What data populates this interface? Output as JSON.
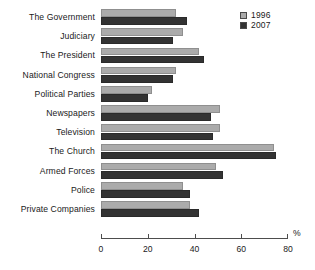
{
  "chart_data": {
    "type": "bar",
    "orientation": "horizontal",
    "title": "",
    "subtitle": "",
    "xlabel": "%",
    "ylabel": "",
    "xlim": [
      0,
      80
    ],
    "xticks": [
      0,
      20,
      40,
      60,
      80
    ],
    "grid": false,
    "legend_position": "top-right",
    "categories": [
      "The Government",
      "Judiciary",
      "The President",
      "National Congress",
      "Political Parties",
      "Newspapers",
      "Television",
      "The Church",
      "Armed Forces",
      "Police",
      "Private Companies"
    ],
    "series": [
      {
        "name": "1996",
        "color": "#ababab",
        "values": [
          32,
          35,
          42,
          32,
          22,
          51,
          51,
          74,
          49,
          35,
          38
        ]
      },
      {
        "name": "2007",
        "color": "#333333",
        "values": [
          37,
          31,
          44,
          31,
          20,
          47,
          48,
          75,
          52,
          38,
          42
        ]
      }
    ]
  },
  "legend": {
    "entries": [
      {
        "label": "1996",
        "swatch": "light-gray-swatch"
      },
      {
        "label": "2007",
        "swatch": "dark-swatch"
      }
    ]
  },
  "axis": {
    "unit_label": "%",
    "tick_labels": [
      "0",
      "20",
      "40",
      "60",
      "80"
    ]
  }
}
